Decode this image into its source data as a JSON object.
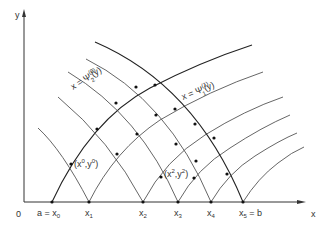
{
  "diagram": {
    "axes": {
      "y_label": "y",
      "x_label": "x",
      "origin_label": "0"
    },
    "base_points": [
      {
        "id": "x0",
        "label": "a = x",
        "sub": "0"
      },
      {
        "id": "x1",
        "label": "x",
        "sub": "1"
      },
      {
        "id": "x2",
        "label": "x",
        "sub": "2"
      },
      {
        "id": "x3",
        "label": "x",
        "sub": "3"
      },
      {
        "id": "x4",
        "label": "x",
        "sub": "4"
      },
      {
        "id": "x5",
        "label": "x",
        "sub": "5",
        "suffix": " = b"
      }
    ],
    "curve_labels": {
      "psi2": {
        "prefix": "x = Ψ",
        "sup": "(0)",
        "sub": "2",
        "suffix": "(y)"
      },
      "psi1": {
        "prefix": "x = Ψ",
        "sup": "(1)",
        "sub": "1",
        "suffix": "(y)"
      }
    },
    "point_labels": {
      "p0": {
        "text": "(x",
        "sup1": "0",
        "mid": ",y",
        "sup2": "0",
        "end": ")"
      },
      "p2": {
        "text": "(x",
        "sup1": "2",
        "mid": ",y",
        "sup2": "2",
        "end": ")"
      }
    },
    "colors": {
      "curve": "#555555",
      "bold_curve": "#222222",
      "axis": "#333333",
      "node": "#111111",
      "text": "#333333"
    }
  }
}
